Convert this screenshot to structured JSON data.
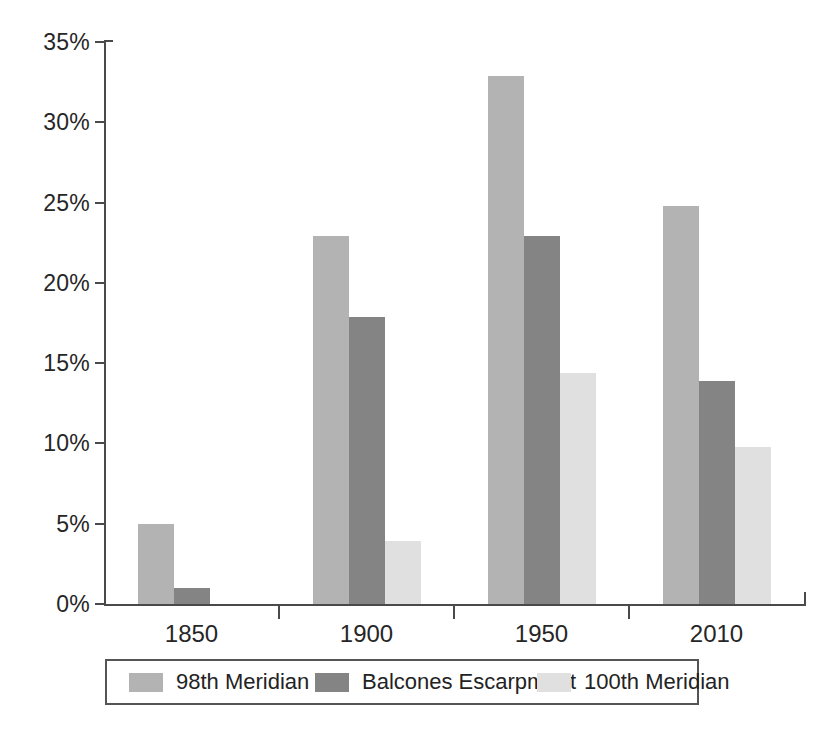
{
  "chart_data": {
    "type": "bar",
    "title": "",
    "subtitle": "",
    "xlabel": "",
    "ylabel": "",
    "categories": [
      "1850",
      "1900",
      "1950",
      "2010"
    ],
    "series": [
      {
        "name": "98th Meridian",
        "color": "#b3b3b3",
        "values": [
          5.0,
          22.9,
          32.9,
          24.8
        ]
      },
      {
        "name": "Balcones Escarpment",
        "color": "#848484",
        "values": [
          1.0,
          17.9,
          22.9,
          13.9
        ]
      },
      {
        "name": "100th Meridian",
        "color": "#e0e0e0",
        "values": [
          0.0,
          3.9,
          14.4,
          9.8
        ]
      }
    ],
    "ylim": [
      0,
      35
    ],
    "ytick_labels": [
      "0%",
      "5%",
      "10%",
      "15%",
      "20%",
      "25%",
      "30%",
      "35%"
    ],
    "ytick_values": [
      0,
      5,
      10,
      15,
      20,
      25,
      30,
      35
    ],
    "grid": false,
    "legend_position": "bottom",
    "value_suffix": "%"
  },
  "legend": {
    "entries": [
      {
        "label": "98th Meridian"
      },
      {
        "label": "Balcones Escarpment"
      },
      {
        "label": "100th Meridian"
      }
    ]
  },
  "caption": {
    "text": ""
  }
}
